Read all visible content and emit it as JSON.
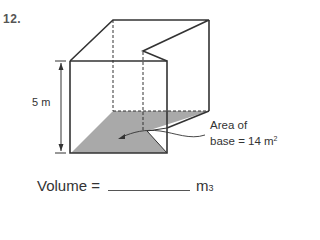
{
  "problem": {
    "number": "12.",
    "height_label": "5 m",
    "area_label_line1": "Area of",
    "area_label_line2_prefix": "base = 14 m",
    "area_label_exponent": "2",
    "volume_prefix": "Volume =",
    "volume_unit": "m",
    "volume_unit_exponent": "3",
    "answer_value": ""
  },
  "figure": {
    "type": "prism with notched base",
    "height_m": 5,
    "base_area_m2": 14,
    "stroke_color": "#333333",
    "shade_color": "#a9a9a9"
  }
}
